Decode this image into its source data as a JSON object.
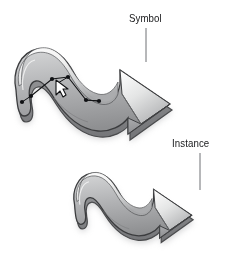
{
  "figure": {
    "background_color": "#ffffff",
    "width": 242,
    "height": 258
  },
  "annotations": {
    "symbol": {
      "label": "Symbol",
      "x": 129,
      "y": 12,
      "leader_line": {
        "x": 146,
        "y_start": 28,
        "y_end": 62,
        "color": "#6f7175"
      }
    },
    "instance": {
      "label": "Instance",
      "x": 172,
      "y": 137,
      "leader_line": {
        "x": 200,
        "y_start": 153,
        "y_end": 190,
        "color": "#6f7175"
      }
    }
  },
  "graphics": {
    "symbol_arrow": {
      "name": "squiggly-arrow",
      "selected": true,
      "shadow_color": "#b9b9b9",
      "outline_color": "#3b3c3e",
      "highlight_color": "#fbfbfb",
      "midtone_color": "#b7b8ba",
      "shadow_face_color": "#8a8b8d"
    },
    "instance_arrow": {
      "name": "squiggly-arrow",
      "selected": false,
      "shadow_color": "#b9b9b9",
      "outline_color": "#3b3c3e",
      "highlight_color": "#fbfbfb",
      "midtone_color": "#b7b8ba",
      "shadow_face_color": "#8a8b8d"
    }
  },
  "selection": {
    "path_color": "#121315",
    "anchor_color": "#101114",
    "anchor_points": [
      {
        "x": 31,
        "y": 96
      },
      {
        "x": 52,
        "y": 79
      },
      {
        "x": 68,
        "y": 77
      },
      {
        "x": 86,
        "y": 100
      },
      {
        "x": 99,
        "y": 101
      }
    ],
    "cursor": {
      "name": "pointer-arrow-cursor",
      "x": 56,
      "y": 80,
      "fill": "#ffffff",
      "stroke": "#121315"
    }
  }
}
